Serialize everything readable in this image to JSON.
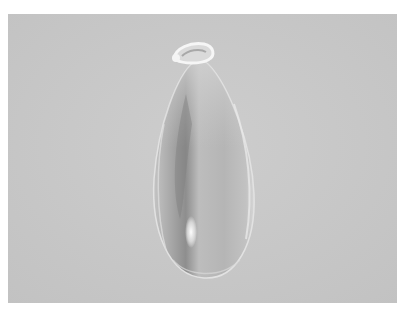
{
  "image": {
    "subject": "glass teardrop pendant",
    "description": "Clear glass teardrop-shaped pendant with a small loop at the top, photographed against a plain light gray background with a white border",
    "colors": {
      "border": "#ffffff",
      "background": "#c9c9c9",
      "drop_body": "#bdbdbd",
      "drop_shadow": "#8f8f8f",
      "highlight": "#ffffff"
    }
  }
}
